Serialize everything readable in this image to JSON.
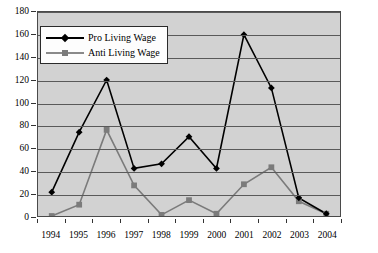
{
  "chart_data": {
    "type": "line",
    "title": "",
    "subtitle": "",
    "xlabel": "",
    "ylabel": "",
    "categories": [
      "1994",
      "1995",
      "1996",
      "1997",
      "1998",
      "1999",
      "2000",
      "2001",
      "2002",
      "2003",
      "2004"
    ],
    "ylim": [
      0,
      180
    ],
    "ytick_step": 20,
    "yticks": [
      "0",
      "20",
      "40",
      "60",
      "80",
      "100",
      "120",
      "140",
      "160",
      "180"
    ],
    "grid": "horizontal",
    "legend_position": "upper-left",
    "series": [
      {
        "name": "Pro Living Wage",
        "marker": "diamond",
        "color": "#000000",
        "values": [
          21,
          74,
          120,
          42,
          46,
          70,
          42,
          160,
          113,
          16,
          2
        ]
      },
      {
        "name": "Anti Living Wage",
        "marker": "square",
        "color": "#7b7b7b",
        "values": [
          0,
          10,
          76,
          27,
          1,
          14,
          2,
          28,
          43,
          13,
          2
        ]
      }
    ],
    "plot_background": "#d2d2d2",
    "gridline_color": "#5a5a5a",
    "axis_color": "#333333"
  },
  "legend": {
    "items": [
      {
        "label": "Pro Living Wage"
      },
      {
        "label": "Anti Living Wage"
      }
    ]
  }
}
